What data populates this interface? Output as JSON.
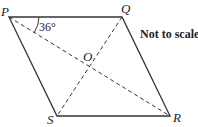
{
  "diagram": {
    "shape": "parallelogram PQRS with diagonals PR and QS",
    "vertices": {
      "P": "P",
      "Q": "Q",
      "R": "R",
      "S": "S",
      "O": "O"
    },
    "angle_label": "36°",
    "note": "Not to scale",
    "colors": {
      "stroke": "#333333",
      "text": "#222222"
    }
  }
}
